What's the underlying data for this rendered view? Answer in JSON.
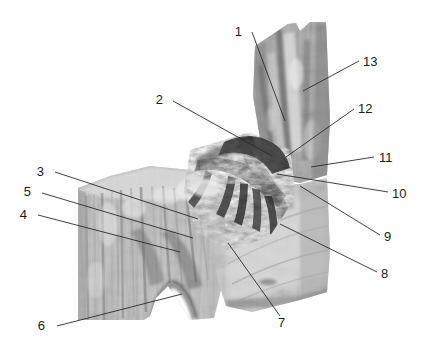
{
  "figure": {
    "background_color": "#ffffff",
    "image_kind": "grayscale-dissection-photograph",
    "width": 426,
    "height": 355,
    "label_color": "#1c1c1c",
    "leader_color": "#2a2a2a"
  },
  "labels": [
    {
      "id": "1",
      "text": "1",
      "tx": 242,
      "ty": 36,
      "lx1": 252,
      "ly1": 32,
      "lx2": 285,
      "ly2": 121
    },
    {
      "id": "2",
      "text": "2",
      "tx": 163,
      "ty": 104,
      "lx1": 173,
      "ly1": 101,
      "lx2": 272,
      "ly2": 156
    },
    {
      "id": "3",
      "text": "3",
      "tx": 44,
      "ty": 176,
      "lx1": 55,
      "ly1": 172,
      "lx2": 198,
      "ly2": 219
    },
    {
      "id": "4",
      "text": "4",
      "tx": 27,
      "ty": 219,
      "lx1": 38,
      "ly1": 215,
      "lx2": 180,
      "ly2": 252
    },
    {
      "id": "5",
      "text": "5",
      "tx": 31,
      "ty": 196,
      "lx1": 42,
      "ly1": 193,
      "lx2": 193,
      "ly2": 238
    },
    {
      "id": "6",
      "text": "6",
      "tx": 45,
      "ty": 330,
      "lx1": 57,
      "ly1": 326,
      "lx2": 182,
      "ly2": 294
    },
    {
      "id": "7",
      "text": "7",
      "tx": 278,
      "ty": 327,
      "lx1": 280,
      "ly1": 316,
      "lx2": 228,
      "ly2": 243
    },
    {
      "id": "8",
      "text": "8",
      "tx": 381,
      "ty": 278,
      "lx1": 377,
      "ly1": 272,
      "lx2": 280,
      "ly2": 224
    },
    {
      "id": "9",
      "text": "9",
      "tx": 384,
      "ty": 241,
      "lx1": 380,
      "ly1": 235,
      "lx2": 300,
      "ly2": 186
    },
    {
      "id": "10",
      "text": "10",
      "tx": 392,
      "ty": 198,
      "lx1": 388,
      "ly1": 192,
      "lx2": 277,
      "ly2": 174
    },
    {
      "id": "11",
      "text": "11",
      "tx": 379,
      "ty": 162,
      "lx1": 374,
      "ly1": 157,
      "lx2": 311,
      "ly2": 167
    },
    {
      "id": "12",
      "text": "12",
      "tx": 358,
      "ty": 113,
      "lx1": 354,
      "ly1": 109,
      "lx2": 286,
      "ly2": 157
    },
    {
      "id": "13",
      "text": "13",
      "tx": 363,
      "ty": 66,
      "lx1": 359,
      "ly1": 61,
      "lx2": 303,
      "ly2": 91
    }
  ],
  "specimen": {
    "name": "dissection-specimen",
    "regions": [
      {
        "name": "upper-vertical-column",
        "description": "tall narrow vertical strip at upper right with notched top"
      },
      {
        "name": "left-muscle-block",
        "description": "broad striated muscle block on the left with arched notch at bottom"
      },
      {
        "name": "central-neurovascular-bundle",
        "description": "dark branching cords converging at centre"
      },
      {
        "name": "lower-right-fascial-sheet",
        "description": "pale fascia sheet filling lower right quadrant"
      }
    ]
  }
}
